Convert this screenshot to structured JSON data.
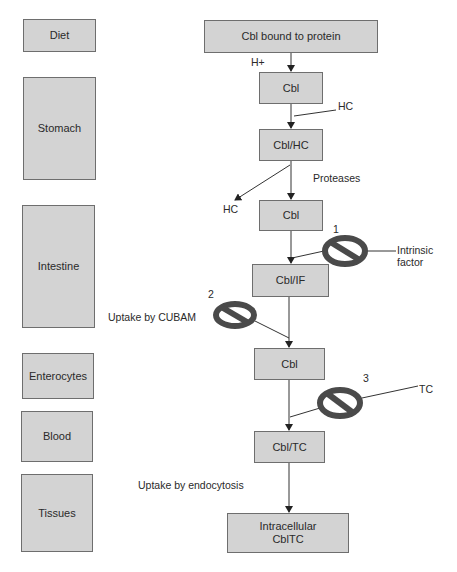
{
  "stages": [
    {
      "id": "diet",
      "label": "Diet"
    },
    {
      "id": "stomach",
      "label": "Stomach"
    },
    {
      "id": "intestine",
      "label": "Intestine"
    },
    {
      "id": "enterocytes",
      "label": "Enterocytes"
    },
    {
      "id": "blood",
      "label": "Blood"
    },
    {
      "id": "tissues",
      "label": "Tissues"
    }
  ],
  "flow": {
    "nodes": [
      {
        "id": "n0",
        "label": "Cbl bound to protein"
      },
      {
        "id": "n1",
        "label": "Cbl"
      },
      {
        "id": "n2",
        "label": "Cbl/HC"
      },
      {
        "id": "n3",
        "label": "Cbl"
      },
      {
        "id": "n4",
        "label": "Cbl/IF"
      },
      {
        "id": "n5",
        "label": "Cbl"
      },
      {
        "id": "n6",
        "label": "Cbl/TC"
      },
      {
        "id": "n7",
        "label": "Intracellular CblTC"
      }
    ],
    "annotations": {
      "h_plus": "H+",
      "hc_in": "HC",
      "proteases": "Proteases",
      "hc_out": "HC",
      "intrinsic_factor_line1": "Intrinsic",
      "intrinsic_factor_line2": "factor",
      "uptake_cubam": "Uptake by CUBAM",
      "tc": "TC",
      "uptake_endocytosis": "Uptake by endocytosis"
    },
    "blocks": [
      {
        "number": "1",
        "icon": "prohibition-sign"
      },
      {
        "number": "2",
        "icon": "prohibition-sign"
      },
      {
        "number": "3",
        "icon": "prohibition-sign"
      }
    ]
  },
  "colors": {
    "box_fill": "#d3d3d3",
    "box_border": "#6e6e6e",
    "sign": "#555555"
  }
}
